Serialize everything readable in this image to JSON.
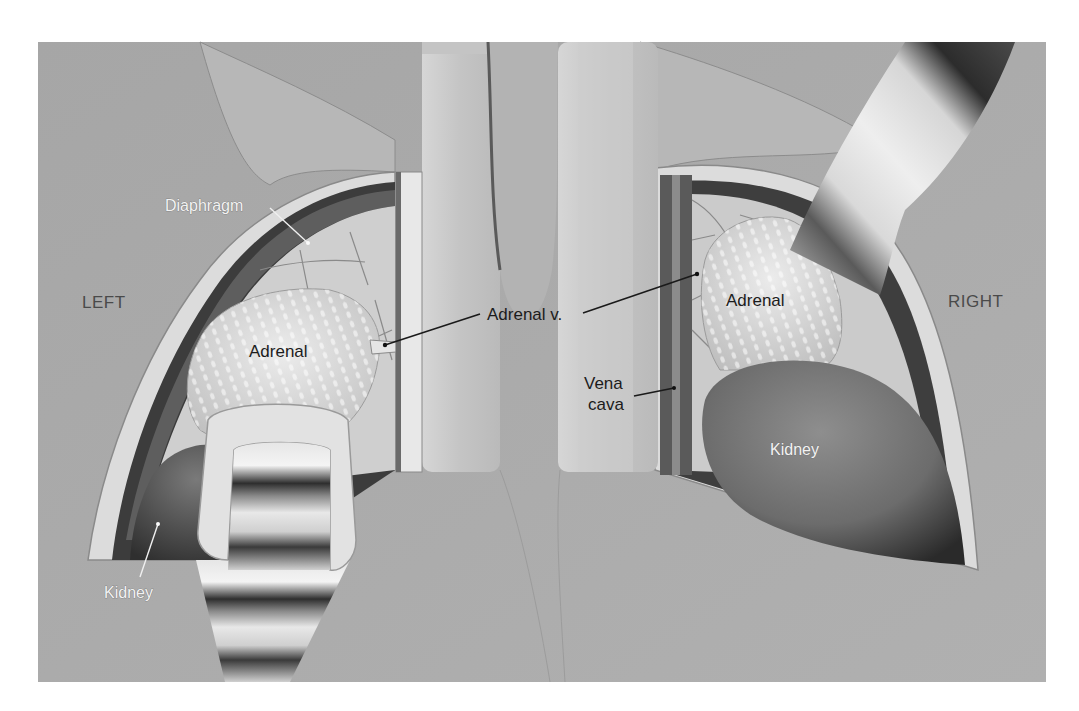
{
  "figure": {
    "colors": {
      "background_tissue": "#a9a9a9",
      "retractor": "#c9c9c9",
      "adrenal": "#d8d8d8",
      "kidney": "#6e6e6e",
      "cavity_dark": "#3a3a3a",
      "label_dark": "#1c1c1c",
      "label_light": "#f2f2f2"
    },
    "side_labels": {
      "left": "LEFT",
      "right": "RIGHT"
    },
    "labels": {
      "diaphragm": "Diaphragm",
      "adrenal_left": "Adrenal",
      "adrenal_vein": "Adrenal v.",
      "kidney_left": "Kidney",
      "adrenal_right": "Adrenal",
      "vena_cava_line1": "Vena",
      "vena_cava_line2": "cava",
      "kidney_right": "Kidney"
    }
  }
}
